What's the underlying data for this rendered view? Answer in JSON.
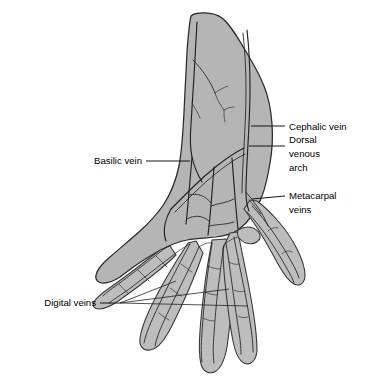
{
  "figure": {
    "type": "anatomical-illustration",
    "background_color": "#ffffff",
    "hand_fill_color": "#b5b5b5",
    "outline_color": "#2b2b2b",
    "vein_color": "#222222",
    "label_color": "#000000",
    "width": 380,
    "height": 379
  },
  "labels": [
    {
      "id": "cephalic-vein",
      "text": "Cephalic vein",
      "align": "start",
      "text_x": 289,
      "text_y": 127,
      "leader": "M 251 126 L 285 126"
    },
    {
      "id": "dorsal-venous-arch",
      "text_lines": [
        "Dorsal",
        "venous",
        "arch"
      ],
      "line1": "Dorsal",
      "line2": "venous",
      "line3": "arch",
      "align": "start",
      "text_x": 289,
      "text_y": 146,
      "leader": "M 249 146 L 285 146"
    },
    {
      "id": "metacarpal-veins",
      "text_lines": [
        "Metacarpal",
        "veins"
      ],
      "line1": "Metacarpal",
      "line2": "veins",
      "align": "start",
      "text_x": 289,
      "text_y": 196,
      "leader": "M 252 199 L 285 196"
    },
    {
      "id": "basilic-vein",
      "text": "Basilic vein",
      "align": "end",
      "text_x": 142,
      "text_y": 161,
      "leader": "M 146 161 L 190 161"
    },
    {
      "id": "digital-veins",
      "text": "Digital veins",
      "align": "end",
      "text_x": 96,
      "text_y": 303,
      "leader_main": "M 100 303 L 118 303",
      "leader_fan": [
        "M 118 303 L 175 282",
        "M 118 303 L 228 289",
        "M 118 303 L 247 305"
      ]
    }
  ],
  "anatomy": {
    "structures": [
      "forearm",
      "wrist",
      "dorsum-of-hand",
      "thumb",
      "index-finger",
      "middle-finger",
      "ring-finger",
      "little-finger"
    ],
    "veins_depicted": [
      "cephalic vein",
      "basilic vein",
      "dorsal venous arch",
      "dorsal metacarpal veins",
      "dorsal digital veins"
    ]
  }
}
